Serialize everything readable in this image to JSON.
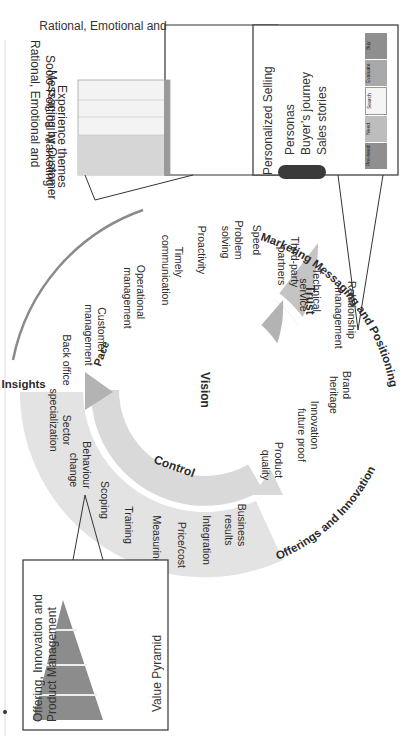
{
  "diagram": {
    "center_label": "Vision",
    "inner_arrows": [
      {
        "label": "Trust",
        "color": "#ffffff"
      },
      {
        "label": "Pace",
        "color": "#b3b3b3"
      },
      {
        "label": "Control",
        "color": "#d9d9d9"
      }
    ],
    "outer_arcs": [
      {
        "label": "Marketing Messaging and Positioning"
      },
      {
        "label": "Sales Insights"
      },
      {
        "label": "Offerings and Innovation"
      }
    ],
    "trust_items": [
      "Brand",
      "heritage",
      "Innovation",
      "future proof",
      "Product",
      "quality",
      "Relationship",
      "management",
      "Technical",
      "service",
      "Third-party",
      "partners"
    ],
    "pace_items": [
      "Speed",
      "Problem",
      "solving",
      "Proactivity",
      "Timely",
      "communication",
      "Operational",
      "management",
      "Customer",
      "management",
      "Back office"
    ],
    "control_items": [
      "Business",
      "results",
      "Integration",
      "Price/cost",
      "Measuring",
      "Training",
      "Scoping",
      "Behaviour",
      "change",
      "Sector",
      "specialization"
    ],
    "colors": {
      "pace_ring": "#c4c4c4",
      "control_ring": "#e3e3e3",
      "trust_ring": "#ffffff",
      "outer_arc": "#8a8a8a"
    }
  },
  "callouts": {
    "marketing": {
      "title_lines": [
        "Rational, Emotional and",
        "Socio-Political Marketing",
        "Messaging by Customer",
        "Experience themes"
      ]
    },
    "sales": {
      "title": "Personalized Selling",
      "bullets": [
        "Personas",
        "Buyer’s journey",
        "Sales stories"
      ],
      "journey_steps": [
        "Pre-need",
        "Need",
        "Search",
        "Evaluate",
        "Buy"
      ]
    },
    "offering": {
      "title_lines": [
        "Offering, Innovation and",
        "Product Management"
      ],
      "caption": "Value Pyramid"
    }
  }
}
